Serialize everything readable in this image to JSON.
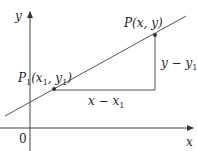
{
  "figure": {
    "type": "slope-diagram",
    "axes": {
      "x_label": "x",
      "y_label": "y",
      "origin_label": "0"
    },
    "points": {
      "p1": {
        "name": "P",
        "sub": "1",
        "coords_label": "(x",
        "coords_sub": "1",
        "mid": ", y",
        "mid_sub": "1",
        "close": ")"
      },
      "p": {
        "label": "P",
        "coords": "(x, y)"
      }
    },
    "legs": {
      "horizontal": {
        "label": "x − x",
        "sub": "1"
      },
      "vertical": {
        "label": "y − y",
        "sub": "1"
      }
    },
    "colors": {
      "line": "#555555",
      "axis": "#444444",
      "point": "#333333",
      "text": "#2a2a2a"
    }
  }
}
